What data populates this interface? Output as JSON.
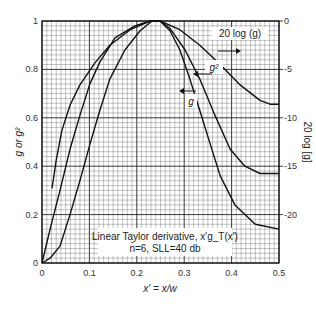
{
  "chart_data": {
    "type": "line",
    "title": "",
    "annotation": [
      "Linear Taylor derivative, x'g_T(x')",
      "n̄=6, SLL=40 db"
    ],
    "xlabel": "x' = x/w",
    "ylabel": "g or g²",
    "ylabel_right": "20 log [g]",
    "xlim": [
      0,
      0.5
    ],
    "ylim": [
      0,
      1
    ],
    "ylim_right": [
      -25,
      0
    ],
    "x_ticks": [
      "0",
      "0.1",
      "0.2",
      "0.3",
      "0.4",
      "0.5"
    ],
    "y_ticks": [
      "0",
      "0.2",
      "0.4",
      "0.6",
      "0.8",
      "1"
    ],
    "y_ticks_right": [
      "0",
      "-5",
      "-10",
      "-15",
      "-20"
    ],
    "grid": true,
    "series": [
      {
        "name": "20 log (g)",
        "axis": "right",
        "x": [
          0.021,
          0.03,
          0.042,
          0.059,
          0.08,
          0.112,
          0.143,
          0.186,
          0.228,
          0.249,
          0.291,
          0.333,
          0.376,
          0.418,
          0.46,
          0.481,
          0.5
        ],
        "values": [
          -17.3,
          -14.4,
          -11.3,
          -8.7,
          -6.6,
          -4.3,
          -2.5,
          -0.9,
          0.0,
          0.0,
          -0.9,
          -2.5,
          -4.5,
          -6.6,
          -8.2,
          -8.6,
          -8.6
        ]
      },
      {
        "name": "g",
        "axis": "left",
        "x": [
          0.0,
          0.017,
          0.038,
          0.059,
          0.08,
          0.101,
          0.122,
          0.154,
          0.196,
          0.228,
          0.249,
          0.27,
          0.302,
          0.333,
          0.365,
          0.397,
          0.428,
          0.46,
          0.5
        ],
        "values": [
          0.0,
          0.14,
          0.3,
          0.47,
          0.61,
          0.74,
          0.83,
          0.93,
          0.98,
          1.0,
          1.0,
          0.97,
          0.88,
          0.76,
          0.61,
          0.47,
          0.4,
          0.37,
          0.37
        ]
      },
      {
        "name": "g²",
        "axis": "left",
        "x": [
          0.0,
          0.017,
          0.038,
          0.059,
          0.08,
          0.101,
          0.122,
          0.143,
          0.175,
          0.207,
          0.232,
          0.249,
          0.27,
          0.291,
          0.312,
          0.333,
          0.355,
          0.376,
          0.407,
          0.45,
          0.5
        ],
        "values": [
          0.0,
          0.02,
          0.07,
          0.2,
          0.34,
          0.49,
          0.63,
          0.76,
          0.88,
          0.96,
          1.0,
          1.0,
          0.96,
          0.88,
          0.76,
          0.63,
          0.49,
          0.36,
          0.24,
          0.16,
          0.14
        ]
      }
    ],
    "curve_labels": [
      {
        "text": "20 log (g)",
        "arrow": "right"
      },
      {
        "text": "g²",
        "arrow": "left"
      },
      {
        "text": "g",
        "arrow": "left"
      }
    ]
  }
}
